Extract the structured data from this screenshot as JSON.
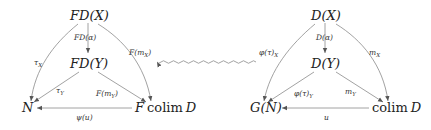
{
  "left_diagram": {
    "nodes": {
      "top": "FD(X)",
      "middle": "FD(Y)",
      "bottom_left": "N",
      "bottom_right_prefix": "F",
      "bottom_right_colim": "colim",
      "bottom_right_suffix": "D"
    },
    "edges": {
      "top_to_middle": "FD(α)",
      "top_to_bottom_left": "τ",
      "top_to_bottom_left_sub": "X",
      "top_to_bottom_right": "F(m",
      "top_to_bottom_right_sub": "X",
      "top_to_bottom_right_close": ")",
      "middle_to_bottom_left": "τ",
      "middle_to_bottom_left_sub": "Y",
      "middle_to_bottom_right": "F(m",
      "middle_to_bottom_right_sub": "Y",
      "middle_to_bottom_right_close": ")",
      "bottom_right_to_bottom_left": "ψ(u)"
    }
  },
  "right_diagram": {
    "nodes": {
      "top": "D(X)",
      "middle": "D(Y)",
      "bottom_left": "G(N)",
      "bottom_right_colim": "colim",
      "bottom_right_suffix": "D"
    },
    "edges": {
      "top_to_middle": "D(α)",
      "top_to_bottom_left": "φ(τ)",
      "top_to_bottom_left_sub": "X",
      "top_to_bottom_right": "m",
      "top_to_bottom_right_sub": "X",
      "middle_to_bottom_left": "φ(τ)",
      "middle_to_bottom_left_sub": "Y",
      "middle_to_bottom_right": "m",
      "middle_to_bottom_right_sub": "Y",
      "bottom_right_to_bottom_left": "u"
    }
  },
  "correspondence_arrow": {
    "direction": "right-to-left",
    "style": "wavy"
  },
  "colors": {
    "ink": "#222222",
    "edge": "#8a8a8a",
    "background": "#ffffff"
  }
}
